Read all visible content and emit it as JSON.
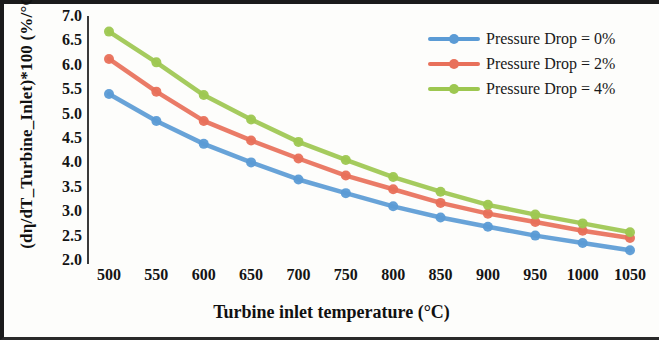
{
  "axes": {
    "x_title": "Turbine inlet temperature (°C)",
    "y_title": "(dη/dT_Turbine_Inlet)*100  (%/°C)",
    "x_ticks": [
      "500",
      "550",
      "600",
      "650",
      "700",
      "750",
      "800",
      "850",
      "900",
      "950",
      "1000",
      "1050"
    ],
    "y_ticks": [
      "7.0",
      "6.5",
      "6.0",
      "5.5",
      "5.0",
      "4.5",
      "4.0",
      "3.5",
      "3.0",
      "2.5",
      "2.0"
    ]
  },
  "legend": {
    "items": [
      {
        "label": "Pressure Drop = 0%",
        "color": "#5b9bd5"
      },
      {
        "label": "Pressure Drop = 2%",
        "color": "#e8705a"
      },
      {
        "label": "Pressure Drop = 4%",
        "color": "#9dc750"
      }
    ]
  },
  "chart_data": {
    "type": "line",
    "title": "",
    "xlabel": "Turbine inlet temperature (°C)",
    "ylabel": "(dη/dT_Turbine_Inlet)*100  (%/°C)",
    "x": [
      500,
      550,
      600,
      650,
      700,
      750,
      800,
      850,
      900,
      950,
      1000,
      1050
    ],
    "xlim": [
      500,
      1050
    ],
    "ylim": [
      2.0,
      7.0
    ],
    "grid": false,
    "legend_position": "top-right",
    "series": [
      {
        "name": "Pressure Drop = 0%",
        "color": "#5b9bd5",
        "values": [
          5.4,
          4.85,
          4.38,
          4.0,
          3.65,
          3.37,
          3.1,
          2.87,
          2.68,
          2.5,
          2.35,
          2.2
        ]
      },
      {
        "name": "Pressure Drop = 2%",
        "color": "#e8705a",
        "values": [
          6.12,
          5.45,
          4.85,
          4.45,
          4.08,
          3.73,
          3.45,
          3.17,
          2.95,
          2.78,
          2.6,
          2.45
        ]
      },
      {
        "name": "Pressure Drop = 4%",
        "color": "#9dc750",
        "values": [
          6.68,
          6.05,
          5.38,
          4.88,
          4.42,
          4.05,
          3.7,
          3.4,
          3.13,
          2.93,
          2.75,
          2.57
        ]
      }
    ]
  }
}
